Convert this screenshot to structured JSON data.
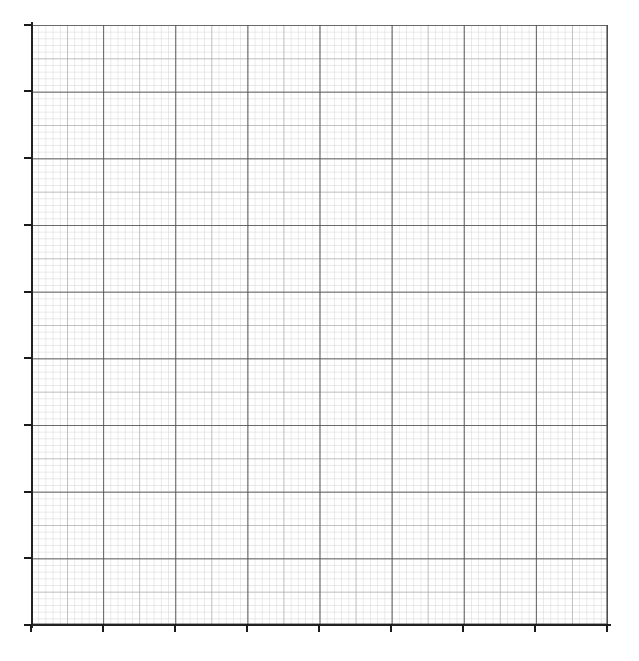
{
  "figure": {
    "kind": "graph-paper",
    "background_color": "#ffffff",
    "plot": {
      "x_px": 31,
      "y_px": 25,
      "width_px": 577,
      "height_px": 600
    },
    "axis_color": "#222222",
    "major_gridline_color": "#555555",
    "medium_gridline_color": "#8a8a8a",
    "minor_gridline_color": "#cccccc"
  },
  "chart_data": {
    "type": "line",
    "title": "",
    "subtitle": "",
    "xlabel": "",
    "ylabel": "",
    "series": [
      {
        "name": "",
        "x": [],
        "y": []
      }
    ],
    "categories": [],
    "values": [],
    "xlim": [
      0,
      8
    ],
    "ylim": [
      0,
      9
    ],
    "x_major_ticks": [
      0,
      1,
      2,
      3,
      4,
      5,
      6,
      7,
      8
    ],
    "y_major_ticks": [
      0,
      1,
      2,
      3,
      4,
      5,
      6,
      7,
      8,
      9
    ],
    "x_tick_labels": [
      "",
      "",
      "",
      "",
      "",
      "",
      "",
      "",
      ""
    ],
    "y_tick_labels": [
      "",
      "",
      "",
      "",
      "",
      "",
      "",
      "",
      "",
      ""
    ],
    "grid": true,
    "grid_minor": true,
    "minor_divisions_per_major": 10,
    "legend": null,
    "legend_position": "none",
    "annotations": [],
    "data_labels": []
  },
  "axes": {
    "x": {
      "major_tick_px": [
        31,
        103,
        175,
        247,
        319,
        391,
        463,
        535,
        607
      ],
      "tick_length_px": 8,
      "tick_color": "#1a1a1a"
    },
    "y": {
      "major_tick_px": [
        25,
        91,
        158,
        225,
        292,
        358,
        425,
        492,
        558,
        625
      ],
      "tick_length_px": 8,
      "tick_color": "#1a1a1a"
    }
  }
}
